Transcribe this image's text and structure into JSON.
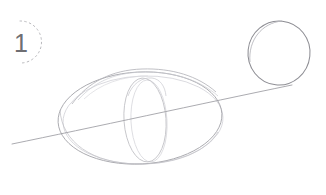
{
  "canvas": {
    "width": 326,
    "height": 195,
    "background_color": "#ffffff",
    "medium": "pencil-sketch"
  },
  "step_marker": {
    "label": "1",
    "label_color": "#6e6e72",
    "badge_style": "dashed-partial-circle",
    "badge_stroke_color": "#b9b9bd",
    "center_x": 28,
    "center_y": 42,
    "radius": 21
  },
  "strokes": {
    "main_ellipse": {
      "name": "body-ellipse",
      "cx": 140,
      "cy": 118,
      "rx": 82,
      "ry": 46,
      "stroke_color": "#a9a9ae",
      "stroke_width": 0.9
    },
    "main_ellipse_ghost": {
      "name": "body-ellipse-ghost-stroke",
      "cx": 143,
      "cy": 120,
      "rx": 80,
      "ry": 44,
      "stroke_color": "#c9c9ce",
      "stroke_width": 0.8
    },
    "inner_ellipse": {
      "name": "inner-vertical-ellipse",
      "cx": 145,
      "cy": 120,
      "rx": 21,
      "ry": 42,
      "stroke_color": "#c2c2c7",
      "stroke_width": 0.9
    },
    "inner_ellipse_ghost": {
      "name": "inner-vertical-ellipse-ghost-stroke",
      "cx": 149,
      "cy": 121,
      "rx": 18,
      "ry": 41,
      "stroke_color": "#d4d4d9",
      "stroke_width": 0.8
    },
    "axis_line": {
      "name": "horizon-axis-line",
      "x1": 12,
      "y1": 144,
      "x2": 292,
      "y2": 85,
      "stroke_color": "#9c9ca2",
      "stroke_width": 0.8
    },
    "small_circle": {
      "name": "head-circle",
      "cx": 279,
      "cy": 53,
      "rx": 32,
      "ry": 32,
      "stroke_color": "#8e8e94",
      "stroke_width": 1.1
    },
    "top_sweep": {
      "name": "top-construction-sweep",
      "stroke_color": "#bdbdc2",
      "stroke_width": 0.8
    }
  }
}
